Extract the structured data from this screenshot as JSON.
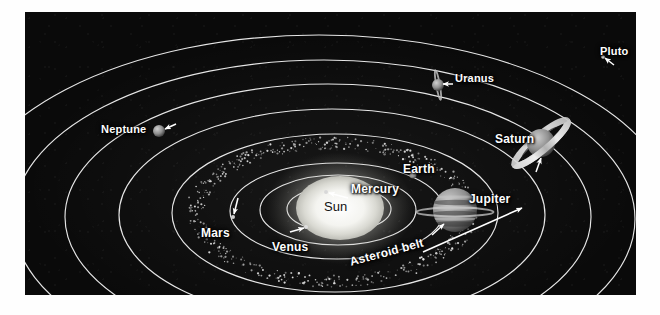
{
  "figure": {
    "kind": "solar-system-diagram",
    "background_color": "#0a0a0a",
    "orbit_color": "#f2f2f2",
    "label_color": "#fdfdfd",
    "sun_label_color": "#121212",
    "panel": {
      "x": 25,
      "y": 12,
      "width": 611,
      "height": 283
    }
  },
  "center": {
    "name": "Sun",
    "label": "Sun",
    "x": 315,
    "y": 196,
    "rx": 44,
    "ry": 32
  },
  "labels": {
    "sun": "Sun",
    "mercury": "Mercury",
    "venus": "Venus",
    "earth": "Earth",
    "mars": "Mars",
    "jupiter": "Jupiter",
    "saturn": "Saturn",
    "uranus": "Uranus",
    "neptune": "Neptune",
    "pluto": "Pluto",
    "asteroid_belt": "Asteroid belt"
  },
  "bodies": [
    {
      "name": "Mercury",
      "label": "Mercury",
      "label_x": 326,
      "label_y": 170,
      "font_size": 12,
      "dot_x": 301,
      "dot_y": 180,
      "radius": 2,
      "color": "#d8d8d8",
      "arrow": {
        "x1": 323,
        "y1": 186,
        "x2": 304,
        "y2": 181
      },
      "rings": "none"
    },
    {
      "name": "Venus",
      "label": "Venus",
      "label_x": 247,
      "label_y": 228,
      "font_size": 12,
      "dot_x": 281,
      "dot_y": 215,
      "radius": 2,
      "color": "#dedede",
      "arrow": {
        "x1": 265,
        "y1": 220,
        "x2": 279,
        "y2": 216
      },
      "rings": "none"
    },
    {
      "name": "Earth",
      "label": "Earth",
      "label_x": 378,
      "label_y": 150,
      "font_size": 12,
      "dot_x": 388,
      "dot_y": 163,
      "radius": 3.5,
      "color": "#e8e8e8",
      "arrow": null,
      "rings": "none"
    },
    {
      "name": "Mars",
      "label": "Mars",
      "label_x": 176,
      "label_y": 214,
      "font_size": 12,
      "dot_x": 208,
      "dot_y": 205,
      "radius": 2,
      "color": "#cfcfcf",
      "arrow": {
        "x1": 213,
        "y1": 186,
        "x2": 209,
        "y2": 202
      },
      "rings": "none"
    },
    {
      "name": "Jupiter",
      "label": "Jupiter",
      "label_x": 444,
      "label_y": 180,
      "font_size": 12,
      "dot_x": 430,
      "dot_y": 198,
      "radius": 22,
      "color": "#8d8d8d",
      "arrow": {
        "x1": 407,
        "y1": 223,
        "x2": 419,
        "y2": 212
      },
      "rings": "thin-horizontal"
    },
    {
      "name": "Saturn",
      "label": "Saturn",
      "label_x": 470,
      "label_y": 120,
      "font_size": 12,
      "dot_x": 516,
      "dot_y": 131,
      "radius": 14,
      "color": "#9a9a9a",
      "arrow": {
        "x1": 511,
        "y1": 160,
        "x2": 516,
        "y2": 146
      },
      "rings": "tilted"
    },
    {
      "name": "Uranus",
      "label": "Uranus",
      "label_x": 430,
      "label_y": 60,
      "font_size": 11,
      "dot_x": 413,
      "dot_y": 73,
      "radius": 6,
      "color": "#a5a5a5",
      "arrow": {
        "x1": 428,
        "y1": 72,
        "x2": 418,
        "y2": 72
      },
      "rings": "vertical"
    },
    {
      "name": "Neptune",
      "label": "Neptune",
      "label_x": 76,
      "label_y": 111,
      "font_size": 11,
      "dot_x": 134,
      "dot_y": 119,
      "radius": 6,
      "color": "#9e9e9e",
      "arrow": {
        "x1": 151,
        "y1": 112,
        "x2": 140,
        "y2": 117
      },
      "rings": "none"
    },
    {
      "name": "Pluto",
      "label": "Pluto",
      "label_x": 575,
      "label_y": 33,
      "font_size": 11,
      "dot_x": 578,
      "dot_y": 45,
      "radius": 1.8,
      "color": "#d5d5d5",
      "arrow": {
        "x1": 589,
        "y1": 53,
        "x2": 580,
        "y2": 46
      },
      "rings": "none"
    }
  ],
  "asteroid_belt": {
    "label": "Asteroid belt",
    "label_x": 325,
    "label_y": 243,
    "font_size": 12,
    "rotation_deg": -15,
    "arrow": {
      "x1": 398,
      "y1": 240,
      "x2": 497,
      "y2": 196
    },
    "inner_rx": 128,
    "inner_ry": 63,
    "outer_rx": 146,
    "outer_ry": 75,
    "dot_count": 540
  },
  "orbits": [
    {
      "body": "Mercury",
      "rx": 30,
      "ry": 13,
      "cx": 315,
      "cy": 196
    },
    {
      "body": "Venus",
      "rx": 52,
      "ry": 23,
      "cx": 314,
      "cy": 197
    },
    {
      "body": "Earth",
      "rx": 78,
      "ry": 35,
      "cx": 313,
      "cy": 198
    },
    {
      "body": "Mars",
      "rx": 107,
      "ry": 48,
      "cx": 312,
      "cy": 199
    },
    {
      "body": "Jupiter",
      "rx": 163,
      "ry": 79,
      "cx": 310,
      "cy": 201
    },
    {
      "body": "Saturn",
      "rx": 213,
      "ry": 106,
      "cx": 307,
      "cy": 203
    },
    {
      "body": "Uranus",
      "rx": 263,
      "ry": 133,
      "cx": 303,
      "cy": 205
    },
    {
      "body": "Neptune",
      "rx": 311,
      "ry": 159,
      "cx": 299,
      "cy": 207
    },
    {
      "body": "Pluto",
      "rx": 358,
      "ry": 186,
      "cx": 294,
      "cy": 209
    }
  ]
}
